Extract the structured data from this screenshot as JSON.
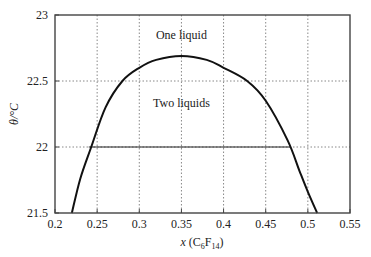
{
  "chart_data": {
    "type": "line",
    "title": "",
    "xlabel": "x (C6F14)",
    "xlabel_parts": {
      "prefix": "x (C",
      "sub1": "6",
      "mid": "F",
      "sub2": "14",
      "suffix": ")"
    },
    "ylabel": "θ/°C",
    "xlim": [
      0.2,
      0.55
    ],
    "ylim": [
      21.5,
      23
    ],
    "xticks": [
      0.2,
      0.25,
      0.3,
      0.35,
      0.4,
      0.45,
      0.5,
      0.55
    ],
    "xtick_labels": [
      "0.2",
      "0.25",
      "0.3",
      "0.35",
      "0.4",
      "0.45",
      "0.5",
      "0.55"
    ],
    "yticks": [
      21.5,
      22,
      22.5,
      23
    ],
    "ytick_labels": [
      "21.5",
      "22",
      "22.5",
      "23"
    ],
    "grid": "dotted",
    "series": [
      {
        "name": "Coexistence curve",
        "x": [
          0.22,
          0.23,
          0.243,
          0.26,
          0.28,
          0.3,
          0.32,
          0.35,
          0.38,
          0.4,
          0.428,
          0.45,
          0.476,
          0.49,
          0.5,
          0.511
        ],
        "y": [
          21.5,
          21.76,
          22.0,
          22.3,
          22.5,
          22.6,
          22.66,
          22.69,
          22.66,
          22.6,
          22.5,
          22.35,
          22.05,
          21.82,
          21.66,
          21.5
        ]
      }
    ],
    "tie_line": {
      "y": 22.0,
      "x_start": 0.24,
      "x_end": 0.48
    },
    "annotations": [
      {
        "text": "One liquid",
        "x": 0.35,
        "y": 22.85
      },
      {
        "text": "Two liquids",
        "x": 0.35,
        "y": 22.33
      }
    ],
    "legend": null
  }
}
